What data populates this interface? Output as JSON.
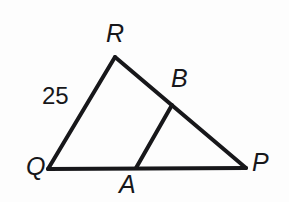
{
  "figure": {
    "kind": "geometry-diagram",
    "background_color": "#fdfdfd",
    "stroke_color": "#17171a",
    "text_color": "#17171a",
    "width": 289,
    "height": 202
  },
  "labels": {
    "Q": "Q",
    "R": "R",
    "P": "P",
    "A": "A",
    "B": "B"
  },
  "measurements": {
    "QR": "25"
  },
  "geometry": {
    "points": {
      "Q": {
        "x": 48,
        "y": 169
      },
      "R": {
        "x": 115,
        "y": 57
      },
      "P": {
        "x": 246,
        "y": 168
      },
      "A": {
        "x": 136,
        "y": 168
      },
      "B": {
        "x": 172,
        "y": 105
      }
    },
    "segments": [
      {
        "name": "QR",
        "from": "Q",
        "to": "R",
        "width": 4
      },
      {
        "name": "RP",
        "from": "R",
        "to": "P",
        "width": 4
      },
      {
        "name": "QP",
        "from": "Q",
        "to": "P",
        "width": 4
      },
      {
        "name": "AB",
        "from": "A",
        "to": "B",
        "width": 4
      }
    ]
  }
}
